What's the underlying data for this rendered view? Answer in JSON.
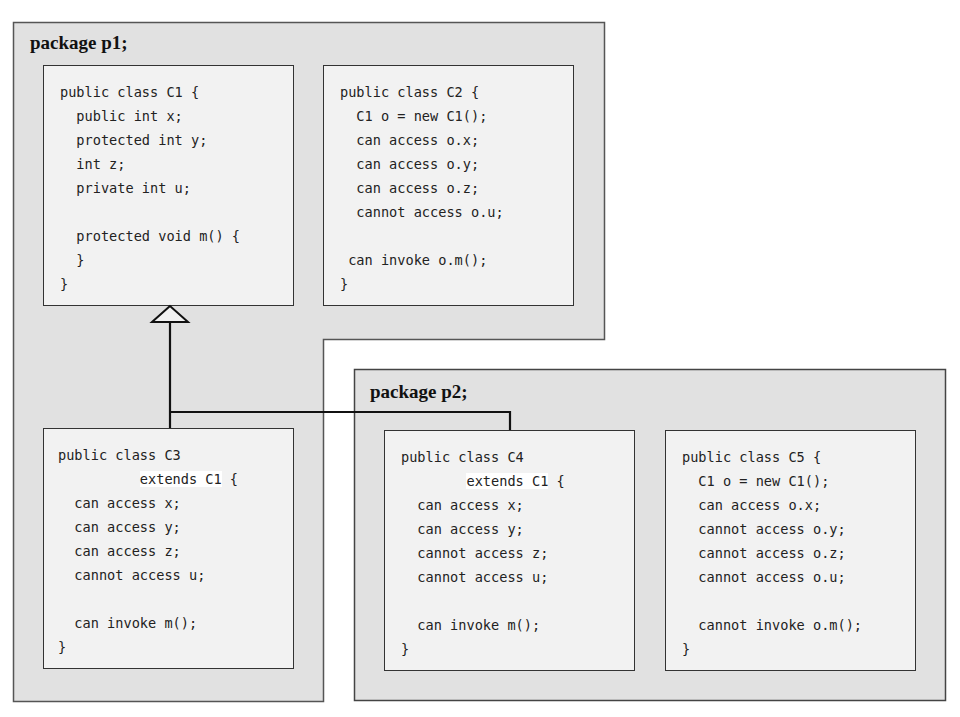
{
  "packages": [
    {
      "id": "p1",
      "title": "package p1;"
    },
    {
      "id": "p2",
      "title": "package p2;"
    }
  ],
  "classes": {
    "c1": {
      "name": "C1",
      "package": "p1",
      "lines": [
        "public class C1 {",
        "  public int x;",
        "  protected int y;",
        "  int z;",
        "  private int u;",
        "",
        "  protected void m() {",
        "  }",
        "}"
      ]
    },
    "c2": {
      "name": "C2",
      "package": "p1",
      "lines": [
        "public class C2 {",
        "  C1 o = new C1();",
        "  can access o.x;",
        "  can access o.y;",
        "  can access o.z;",
        "  cannot access o.u;",
        "",
        " can invoke o.m();",
        "}"
      ]
    },
    "c3": {
      "name": "C3",
      "package": "p1",
      "header": "public class C3",
      "extends_prefix": "          ",
      "extends_text": "extends C1",
      "extends_suffix": " {",
      "lines": [
        "  can access x;",
        "  can access y;",
        "  can access z;",
        "  cannot access u;",
        "",
        "  can invoke m();",
        "}"
      ]
    },
    "c4": {
      "name": "C4",
      "package": "p2",
      "header": "public class C4",
      "extends_prefix": "        ",
      "extends_text": "extends C1",
      "extends_suffix": " {",
      "lines": [
        "  can access x;",
        "  can access y;",
        "  cannot access z;",
        "  cannot access u;",
        "",
        "  can invoke m();",
        "}"
      ]
    },
    "c5": {
      "name": "C5",
      "package": "p2",
      "lines": [
        "public class C5 {",
        "  C1 o = new C1();",
        "  can access o.x;",
        "  cannot access o.y;",
        "  cannot access o.z;",
        "  cannot access o.u;",
        "",
        "  cannot invoke o.m();",
        "}"
      ]
    }
  },
  "relationships": [
    {
      "type": "inheritance",
      "from": "C3",
      "to": "C1"
    },
    {
      "type": "inheritance",
      "from": "C4",
      "to": "C1"
    }
  ],
  "colors": {
    "package_bg": "#e1e1e1",
    "class_bg": "#f2f2f2",
    "border": "#333333",
    "highlight": "#ffffff"
  }
}
